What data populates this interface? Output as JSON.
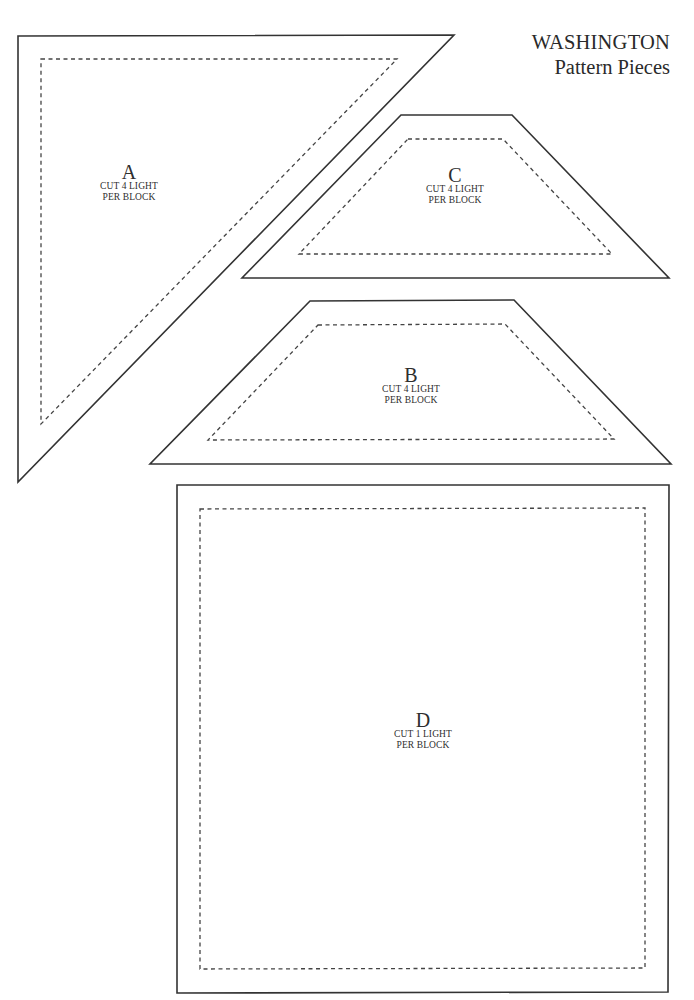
{
  "title": {
    "line1": "WASHINGTON",
    "line2": "Pattern Pieces"
  },
  "colors": {
    "background": "#ffffff",
    "outline": "#333333",
    "seam_line": "#444444",
    "text": "#2b2b2b"
  },
  "pieces": [
    {
      "id": "A",
      "letter": "A",
      "cut_line": "CUT 4 LIGHT",
      "per_line": "PER BLOCK",
      "shape": "right-triangle",
      "outer_points": "18,36 454,35 18,482",
      "inner_points": "41,59 397,59 41,424",
      "label_pos": [
        129,
        163
      ]
    },
    {
      "id": "C",
      "letter": "C",
      "cut_line": "CUT 4 LIGHT",
      "per_line": "PER BLOCK",
      "shape": "trapezoid",
      "outer_points": "401,115 512,115 669,278 242,278",
      "inner_points": "408,139 503,139 612,254 299,254",
      "label_pos": [
        455,
        166
      ]
    },
    {
      "id": "B",
      "letter": "B",
      "cut_line": "CUT 4 LIGHT",
      "per_line": "PER BLOCK",
      "shape": "trapezoid",
      "outer_points": "310,301 514,300 671,464 150,464",
      "inner_points": "318,325 505,324 614,439 208,440",
      "label_pos": [
        411,
        366
      ]
    },
    {
      "id": "D",
      "letter": "D",
      "cut_line": "CUT 1 LIGHT",
      "per_line": "PER BLOCK",
      "shape": "square",
      "outer_points": "177,485 669,485 668,992 177,993",
      "inner_points": "200,509 645,508 645,968 200,969",
      "label_pos": [
        423,
        711
      ]
    }
  ]
}
